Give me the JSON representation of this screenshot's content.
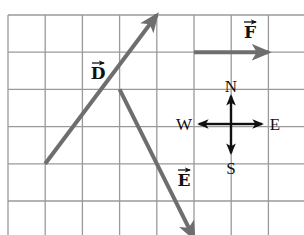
{
  "grid": {
    "origin_x": 8,
    "origin_y": 15,
    "cell": 37.2,
    "cols": 8,
    "rows": 6,
    "line_color": "#9a9a9a",
    "right_border": false
  },
  "vectors": [
    {
      "id": "D",
      "label": "D",
      "from": [
        1,
        4
      ],
      "to": [
        4,
        0
      ],
      "color": "#6e6e6e",
      "label_pos": [
        98,
        79
      ]
    },
    {
      "id": "E",
      "label": "E",
      "from": [
        3,
        2
      ],
      "to": [
        5,
        6
      ],
      "color": "#6e6e6e",
      "label_pos": [
        184,
        186
      ]
    },
    {
      "id": "F",
      "label": "F",
      "from": [
        5,
        1
      ],
      "to": [
        7,
        1
      ],
      "color": "#6e6e6e",
      "label_pos": [
        250,
        38
      ]
    }
  ],
  "compass": {
    "center": [
      231,
      124
    ],
    "labels": {
      "north": "N",
      "south": "S",
      "west": "W",
      "east": "E"
    },
    "color": "#111111"
  }
}
